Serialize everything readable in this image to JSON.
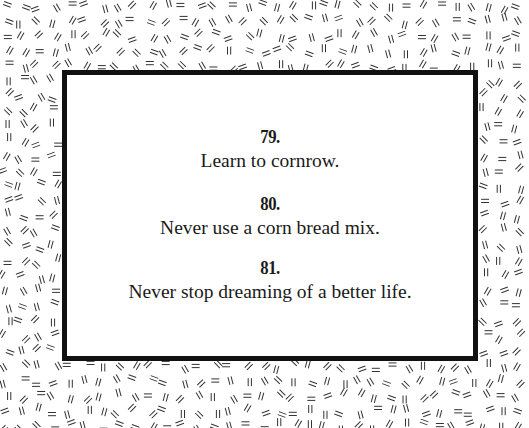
{
  "page": {
    "background_pattern": "double-dash-confetti",
    "colors": {
      "border": "#111111",
      "text": "#1a1a1a",
      "pattern_stroke": "#333333",
      "background": "#ffffff"
    }
  },
  "card": {
    "entries": [
      {
        "number": "79.",
        "text": "Learn to cornrow."
      },
      {
        "number": "80.",
        "text": "Never use a corn bread mix."
      },
      {
        "number": "81.",
        "text": "Never stop dreaming of a better life."
      }
    ]
  }
}
